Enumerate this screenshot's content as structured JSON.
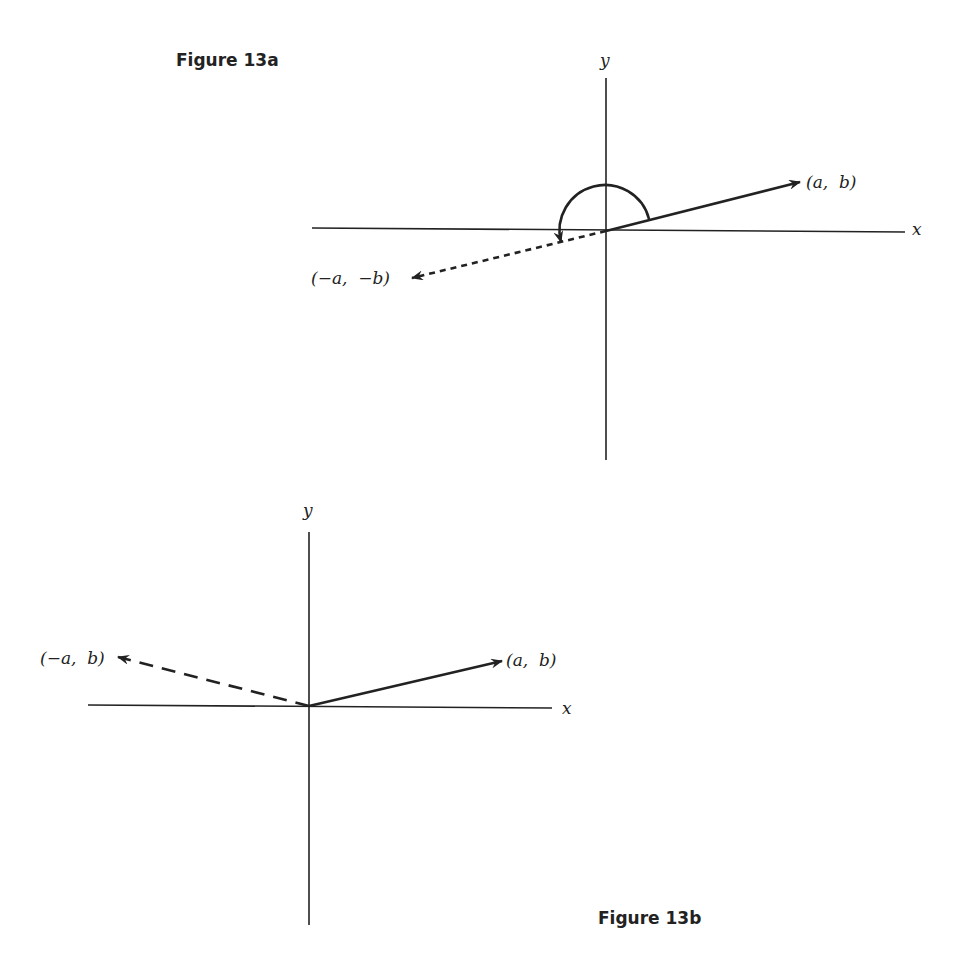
{
  "figure_a": {
    "caption": "Figure 13a",
    "axis_x_label": "x",
    "axis_y_label": "y",
    "vector_label": "(a,  b)",
    "negated_vector_label": "(−a,  −b)",
    "description": "Vector (a, b) rotated by 180 degrees gives (-a, -b)"
  },
  "figure_b": {
    "caption": "Figure 13b",
    "axis_x_label": "x",
    "axis_y_label": "y",
    "vector_label": "(a,  b)",
    "reflected_vector_label": "(−a,  b)",
    "description": "Vector (a, b) reflected in the y-axis gives (-a, b)"
  },
  "colors": {
    "ink": "#222222",
    "background": "#ffffff"
  }
}
